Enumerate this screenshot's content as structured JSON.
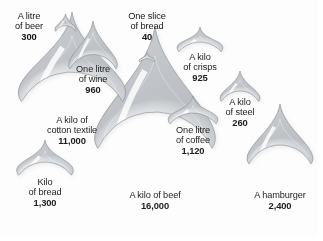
{
  "figure": {
    "background_color": "#fdfdfd",
    "text_color": "#1d1d1d",
    "unit": "litres"
  },
  "chart_data": {
    "type": "bubble",
    "xlabel": "",
    "ylabel": "",
    "unit": "litres of water",
    "legend": "none",
    "grid": false,
    "categories": [
      "One slice of bread",
      "A kilo of steel",
      "A litre of beer",
      "One litre of wine",
      "A kilo of crisps",
      "One litre of coffee",
      "Kilo of bread",
      "A hamburger",
      "A kilo of cotton textile",
      "A kilo of beef"
    ],
    "values": [
      40,
      260,
      300,
      960,
      925,
      1120,
      1300,
      2400,
      11000,
      16000
    ],
    "value_labels": [
      "40",
      "260",
      "300",
      "960",
      "925",
      "1,120",
      "1,300",
      "2,400",
      "11,000",
      "16,000"
    ]
  },
  "drops": [
    {
      "id": "beer",
      "caption_lines": [
        "A litre",
        "of beer"
      ],
      "value": "300",
      "label_position": "outside-left",
      "cx": 65.5,
      "cy": 37.0,
      "r": 11.5,
      "tip_y": 14.0,
      "label_x": 6,
      "label_y": 11,
      "label_w": 46
    },
    {
      "id": "bread-slice",
      "caption_lines": [
        "One slice",
        "of bread"
      ],
      "value": "40",
      "label_position": "outside-top",
      "cx": 147.0,
      "cy": 68.0,
      "r": 9.5,
      "tip_y": 53.0,
      "label_x": 118,
      "label_y": 11,
      "label_w": 58
    },
    {
      "id": "wine",
      "caption_lines": [
        "One litre",
        "of wine"
      ],
      "value": "960",
      "label_position": "inside",
      "cx": 93.0,
      "cy": 80.0,
      "r": 25.5,
      "tip_y": 21.0,
      "label_x": 66,
      "label_y": 64,
      "label_w": 54
    },
    {
      "id": "crisps",
      "caption_lines": [
        "A kilo",
        "of crisps"
      ],
      "value": "925",
      "label_position": "inside",
      "cx": 200.0,
      "cy": 70.0,
      "r": 28.0,
      "tip_y": 27.0,
      "label_x": 172,
      "label_y": 52,
      "label_w": 56
    },
    {
      "id": "steel",
      "caption_lines": [
        "A kilo",
        "of steel"
      ],
      "value": "260",
      "label_position": "inside",
      "cx": 240.0,
      "cy": 113.0,
      "r": 22.0,
      "tip_y": 71.0,
      "label_x": 214,
      "label_y": 97,
      "label_w": 52
    },
    {
      "id": "cotton",
      "caption_lines": [
        "A kilo of",
        "cotton textile"
      ],
      "value": "11,000",
      "label_position": "inside",
      "cx": 72.0,
      "cy": 130.0,
      "r": 58.0,
      "tip_y": 12.0,
      "label_x": 29,
      "label_y": 115,
      "label_w": 86
    },
    {
      "id": "coffee",
      "caption_lines": [
        "One litre",
        "of coffee"
      ],
      "value": "1,120",
      "label_position": "inside",
      "cx": 193.0,
      "cy": 143.0,
      "r": 30.0,
      "tip_y": 96.0,
      "label_x": 163,
      "label_y": 125,
      "label_w": 60
    },
    {
      "id": "bread-kilo",
      "caption_lines": [
        "Kilo",
        "of bread"
      ],
      "value": "1,300",
      "label_position": "inside",
      "cx": 45.0,
      "cy": 195.0,
      "r": 33.0,
      "tip_y": 140.0,
      "label_x": 16,
      "label_y": 177,
      "label_w": 58
    },
    {
      "id": "beef",
      "caption_lines": [
        "A kilo of beef"
      ],
      "value": "16,000",
      "label_position": "inside",
      "cx": 155.0,
      "cy": 175.0,
      "r": 63.0,
      "tip_y": 26.0,
      "label_x": 110,
      "label_y": 190,
      "label_w": 90
    },
    {
      "id": "hamburger",
      "caption_lines": [
        "A hamburger"
      ],
      "value": "2,400",
      "label_position": "inside",
      "cx": 280.0,
      "cy": 180.0,
      "r": 35.0,
      "tip_y": 104.0,
      "label_x": 238,
      "label_y": 190,
      "label_w": 84
    }
  ]
}
